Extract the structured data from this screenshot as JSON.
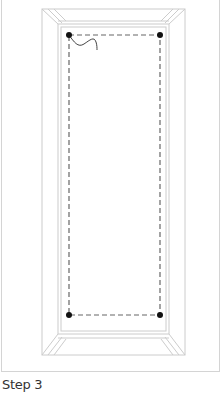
{
  "caption": "Step 3",
  "diagram": {
    "colors": {
      "frame_stroke": "#cccccc",
      "dashed_line": "#666666",
      "corner_dot": "#111111",
      "wire": "#444444"
    },
    "corner_points": [
      "top-left",
      "top-right",
      "bottom-left",
      "bottom-right"
    ]
  }
}
